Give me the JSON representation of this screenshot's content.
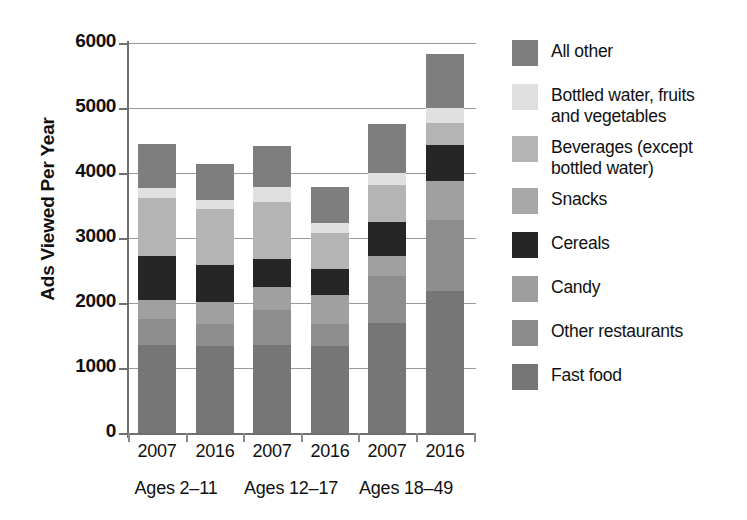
{
  "chart_data": {
    "type": "bar",
    "subtype": "stacked-bar",
    "title": "",
    "xlabel": "",
    "ylabel": "Ads Viewed Per Year",
    "ylim": [
      0,
      6000
    ],
    "ytick_values": [
      0,
      1000,
      2000,
      3000,
      4000,
      5000,
      6000
    ],
    "ytick_labels": [
      "0",
      "1000",
      "2000",
      "3000",
      "4000",
      "5000",
      "6000"
    ],
    "grid": "horizontal",
    "legend_position": "right",
    "categories": [
      "2007",
      "2016",
      "2007",
      "2016",
      "2007",
      "2016"
    ],
    "groups": [
      {
        "label": "Ages 2–11",
        "bars": [
          "2007",
          "2016"
        ]
      },
      {
        "label": "Ages 12–17",
        "bars": [
          "2007",
          "2016"
        ]
      },
      {
        "label": "Ages 18–49",
        "bars": [
          "2007",
          "2016"
        ]
      }
    ],
    "series": [
      {
        "name": "Fast food",
        "color": "#767676",
        "values": [
          1350,
          1340,
          1350,
          1340,
          1700,
          2180
        ]
      },
      {
        "name": "Other restaurants",
        "color": "#8e8e8e",
        "values": [
          400,
          340,
          550,
          340,
          720,
          1090
        ]
      },
      {
        "name": "Candy",
        "color": "#a0a0a0",
        "values": [
          300,
          330,
          350,
          450,
          310,
          600
        ]
      },
      {
        "name": "Cereals",
        "color": "#262626",
        "values": [
          670,
          570,
          430,
          390,
          520,
          560
        ]
      },
      {
        "name": "Beverages (except\nbottled water)",
        "color": "#b4b4b4",
        "values": [
          900,
          860,
          880,
          550,
          570,
          340
        ]
      },
      {
        "name": "Bottled water, fruits\nand vegetables",
        "color": "#e0e0e0",
        "values": [
          150,
          140,
          220,
          160,
          180,
          230
        ]
      },
      {
        "name": "All other",
        "color": "#7e7e7e",
        "values": [
          670,
          560,
          640,
          550,
          750,
          830
        ]
      }
    ],
    "bar_totals": [
      4000,
      3660,
      4200,
      3780,
      4750,
      5830
    ],
    "stack_order_bottom_to_top": [
      "Fast food",
      "Other restaurants",
      "Candy",
      "Cereals",
      "Beverages (except bottled water)",
      "Bottled water, fruits and vegetables",
      "All other"
    ]
  },
  "legend": {
    "items": [
      {
        "label": "All other",
        "color": "#7e7e7e"
      },
      {
        "label": "Bottled water, fruits\nand vegetables",
        "color": "#e0e0e0"
      },
      {
        "label": "Beverages (except\nbottled water)",
        "color": "#b4b4b4"
      },
      {
        "label": "Snacks",
        "color": "#a8a8a8"
      },
      {
        "label": "Cereals",
        "color": "#262626"
      },
      {
        "label": "Candy",
        "color": "#9e9e9e"
      },
      {
        "label": "Other restaurants",
        "color": "#8c8c8c"
      },
      {
        "label": "Fast food",
        "color": "#767676"
      }
    ]
  },
  "axes": {
    "y_title": "Ads Viewed Per Year",
    "y_ticks": [
      "6000",
      "5000",
      "4000",
      "3000",
      "2000",
      "1000",
      "0"
    ],
    "x_ticks": [
      "2007",
      "2016",
      "2007",
      "2016",
      "2007",
      "2016"
    ],
    "group_labels": [
      "Ages 2–11",
      "Ages 12–17",
      "Ages 18–49"
    ]
  }
}
